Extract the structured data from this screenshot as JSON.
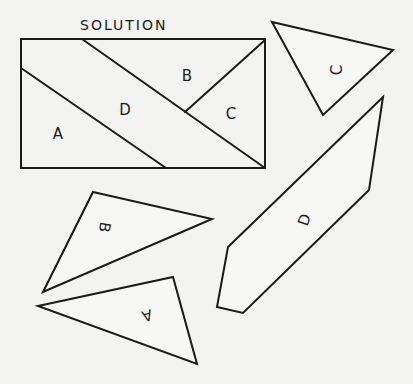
{
  "title": "SOLUTION",
  "colors": {
    "ink": "#1a1a1a",
    "paper": "#f3f3f1"
  },
  "solution": {
    "rect": {
      "x1": 21,
      "y1": 39,
      "x2": 265,
      "y2": 168
    },
    "cuts": [
      {
        "name": "a-d-cut",
        "points": "21,68 166,168"
      },
      {
        "name": "d-bc-cut",
        "points": "82,39 265,168"
      },
      {
        "name": "b-c-cut",
        "points": "185,112 265,40"
      }
    ],
    "labels": [
      {
        "text": "A",
        "x": 58,
        "y": 134,
        "rotate": 0
      },
      {
        "text": "D",
        "x": 125,
        "y": 110,
        "rotate": 0
      },
      {
        "text": "B",
        "x": 187,
        "y": 76,
        "rotate": 0
      },
      {
        "text": "C",
        "x": 231,
        "y": 114,
        "rotate": 0
      }
    ]
  },
  "pieces": [
    {
      "name": "piece-c",
      "label": "C",
      "points": "272,22 393,50 323,115",
      "lx": 337,
      "ly": 70,
      "rotate": -90
    },
    {
      "name": "piece-d",
      "label": "D",
      "points": "383,97 369,190 243,313 217,307 228,247",
      "lx": 305,
      "ly": 220,
      "rotate": -70
    },
    {
      "name": "piece-b",
      "label": "B",
      "points": "93,192 212,219 43,292",
      "lx": 104,
      "ly": 227,
      "rotate": 100
    },
    {
      "name": "piece-a",
      "label": "A",
      "points": "38,306 173,277 197,364",
      "lx": 147,
      "ly": 315,
      "rotate": 165
    }
  ]
}
